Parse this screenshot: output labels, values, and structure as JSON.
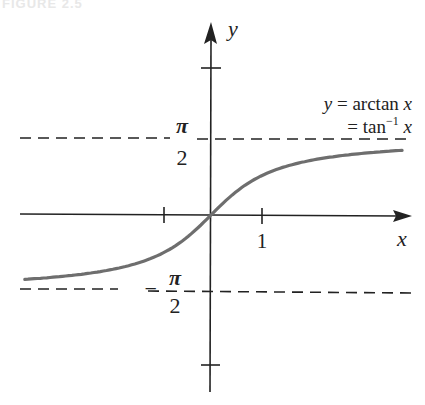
{
  "figure": {
    "caption": "FIGURE 2.5"
  },
  "chart_data": {
    "type": "line",
    "title": "",
    "function": "y = arctan x",
    "annotation_lines": [
      "y = arctan x",
      "= tan⁻¹ x"
    ],
    "xlabel": "x",
    "ylabel": "y",
    "x_tick_labels": [
      "1"
    ],
    "x_ticks": [
      -1,
      1
    ],
    "y_ticks": [
      -3,
      3
    ],
    "asymptotes": [
      {
        "value": 1.5708,
        "label_top": "π",
        "label_bottom": "2",
        "sign": ""
      },
      {
        "value": -1.5708,
        "label_top": "π",
        "label_bottom": "2",
        "sign": "−"
      }
    ],
    "xlim": [
      -3.8,
      4.0
    ],
    "ylim": [
      -3.6,
      3.9
    ],
    "series": [
      {
        "name": "arctan x",
        "color": "#6e6e6e",
        "x": [
          -3.8,
          -3,
          -2,
          -1.5,
          -1,
          -0.5,
          0,
          0.5,
          1,
          1.5,
          2,
          3,
          3.9
        ],
        "y": [
          -1.313,
          -1.249,
          -1.107,
          -0.983,
          -0.785,
          -0.464,
          0,
          0.464,
          0.785,
          0.983,
          1.107,
          1.249,
          1.319
        ]
      }
    ],
    "grid": false,
    "legend": "none",
    "axis_color": "#222222",
    "asymptote_style": "dashed"
  }
}
